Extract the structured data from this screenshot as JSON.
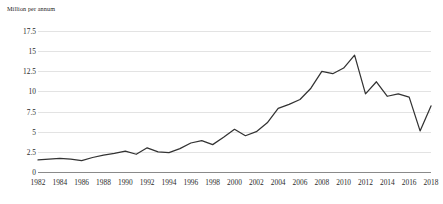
{
  "chart_data": {
    "type": "line",
    "title": "",
    "subtitle": "",
    "xlabel": "",
    "ylabel": "Million per annum",
    "ylim": [
      0,
      17.5
    ],
    "xlim": [
      1982,
      2018
    ],
    "grid": true,
    "legend": false,
    "legend_position": "none",
    "y_ticks": [
      "0",
      "2.5",
      "5",
      "7.5",
      "10",
      "12.5",
      "15",
      "17.5"
    ],
    "y_tick_values": [
      0,
      2.5,
      5,
      7.5,
      10,
      12.5,
      15,
      17.5
    ],
    "x_ticks": [
      "1982",
      "1984",
      "1986",
      "1988",
      "1990",
      "1992",
      "1994",
      "1996",
      "1998",
      "2000",
      "2002",
      "2004",
      "2006",
      "2008",
      "2010",
      "2012",
      "2014",
      "2016",
      "2018"
    ],
    "x_tick_values": [
      1982,
      1984,
      1986,
      1988,
      1990,
      1992,
      1994,
      1996,
      1998,
      2000,
      2002,
      2004,
      2006,
      2008,
      2010,
      2012,
      2014,
      2016,
      2018
    ],
    "line_color": "#333333",
    "grid_color": "#e3e3e3",
    "axis_color": "#8a8a8a",
    "x": [
      1982,
      1983,
      1984,
      1985,
      1986,
      1987,
      1988,
      1989,
      1990,
      1991,
      1992,
      1993,
      1994,
      1995,
      1996,
      1997,
      1998,
      1999,
      2000,
      2001,
      2002,
      2003,
      2004,
      2005,
      2006,
      2007,
      2008,
      2009,
      2010,
      2011,
      2012,
      2013,
      2014,
      2015,
      2016,
      2017,
      2018
    ],
    "series": [
      {
        "name": "Million per annum",
        "values": [
          1.5,
          1.6,
          1.7,
          1.6,
          1.4,
          1.8,
          2.1,
          2.3,
          2.6,
          2.2,
          3.0,
          2.5,
          2.4,
          2.9,
          3.6,
          3.9,
          3.4,
          4.3,
          5.3,
          4.5,
          5.0,
          6.1,
          7.9,
          8.4,
          9.0,
          10.4,
          12.5,
          12.2,
          12.9,
          14.5,
          9.7,
          11.2,
          9.4,
          9.7,
          9.3,
          5.1,
          8.2
        ]
      }
    ]
  }
}
